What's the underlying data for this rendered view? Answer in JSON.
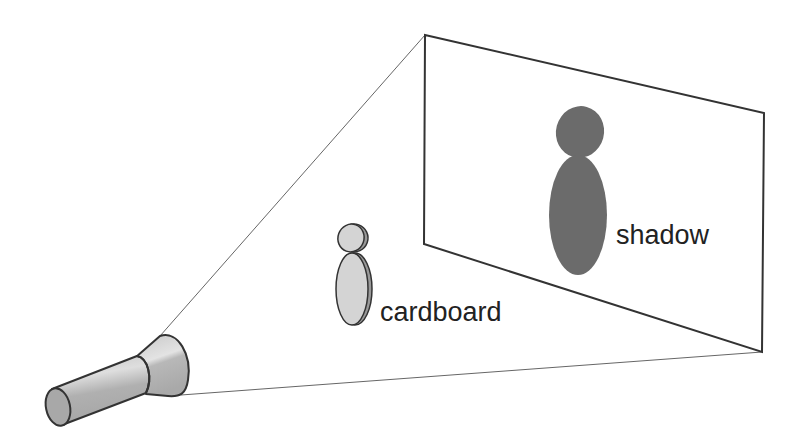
{
  "diagram": {
    "labels": {
      "cardboard": "cardboard",
      "shadow": "shadow"
    },
    "colors": {
      "background": "#ffffff",
      "outline": "#333333",
      "light_beam_line": "#555555",
      "flashlight_body": "#b3b3b3",
      "flashlight_highlight": "#dcdcdc",
      "cardboard_fill": "#d4d4d4",
      "shadow_fill": "#6b6b6b",
      "text": "#222222"
    },
    "elements": [
      {
        "id": "flashlight",
        "description": "light source"
      },
      {
        "id": "cardboard",
        "description": "cardboard cutout figure (head and body ovals)"
      },
      {
        "id": "screen",
        "description": "projection screen in perspective"
      },
      {
        "id": "shadow",
        "description": "enlarged shadow of the cutout on the screen"
      }
    ]
  }
}
